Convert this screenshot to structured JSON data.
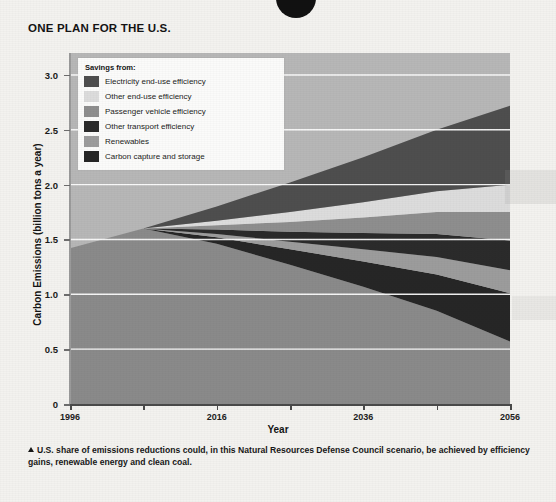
{
  "chart_title": "ONE PLAN FOR THE U.S.",
  "top_glyph": "circle-bullet",
  "legend": {
    "title": "Savings from:",
    "items": [
      {
        "label": "Electricity end-use efficiency",
        "color": "#4e4e4e"
      },
      {
        "label": "Other end-use efficiency",
        "color": "#dcdcdc"
      },
      {
        "label": "Passenger vehicle efficiency",
        "color": "#8e8e8e"
      },
      {
        "label": "Other transport efficiency",
        "color": "#2b2b2b"
      },
      {
        "label": "Renewables",
        "color": "#9c9c9c"
      },
      {
        "label": "Carbon capture and storage",
        "color": "#262626"
      }
    ]
  },
  "caption": "U.S. share of emissions reductions could, in this Natural Resources Defense Council scenario, be achieved by efficiency gains, renewable energy and clean coal.",
  "chart_data": {
    "type": "area",
    "title": "ONE PLAN FOR THE U.S.",
    "xlabel": "Year",
    "ylabel": "Carbon Emissions (billion tons a year)",
    "xlim": [
      1996,
      2056
    ],
    "ylim": [
      0,
      3.2
    ],
    "grid": true,
    "grid_color": "#ffffff",
    "legend_position": "top-left-inside",
    "xticks": [
      1996,
      2016,
      2036,
      2056
    ],
    "xticks_minor": [
      2006,
      2026,
      2046
    ],
    "yticks": [
      0,
      0.5,
      1.0,
      1.5,
      2.0,
      2.5,
      3.0
    ],
    "ytick_labels": [
      "0",
      "0.5",
      "1.0",
      "1.5",
      "2.0",
      "2.5",
      "3.0"
    ],
    "plot_background": "#b7b7b7",
    "x": [
      1996,
      2006,
      2016,
      2026,
      2036,
      2046,
      2056
    ],
    "series": [
      {
        "name": "Business-as-usual total (top of stack)",
        "role": "envelope",
        "values": [
          1.42,
          1.6,
          1.8,
          2.02,
          2.25,
          2.5,
          2.72
        ]
      },
      {
        "name": "Electricity end-use efficiency",
        "color": "#4e4e4e",
        "values": [
          0.0,
          0.0,
          0.13,
          0.27,
          0.41,
          0.56,
          0.72
        ]
      },
      {
        "name": "Other end-use efficiency",
        "color": "#dcdcdc",
        "values": [
          0.0,
          0.0,
          0.04,
          0.09,
          0.14,
          0.19,
          0.25
        ]
      },
      {
        "name": "Passenger vehicle efficiency",
        "color": "#8e8e8e",
        "values": [
          0.0,
          0.0,
          0.04,
          0.09,
          0.14,
          0.2,
          0.26
        ]
      },
      {
        "name": "Other transport efficiency",
        "color": "#2b2b2b",
        "values": [
          0.0,
          0.0,
          0.04,
          0.09,
          0.15,
          0.21,
          0.27
        ]
      },
      {
        "name": "Renewables",
        "color": "#9c9c9c",
        "values": [
          0.0,
          0.0,
          0.03,
          0.07,
          0.11,
          0.16,
          0.21
        ]
      },
      {
        "name": "Carbon capture and storage",
        "color": "#262626",
        "values": [
          0.0,
          0.0,
          0.06,
          0.14,
          0.23,
          0.33,
          0.44
        ]
      },
      {
        "name": "Remaining emissions",
        "color": "#8a8a8a",
        "values": [
          1.42,
          1.6,
          1.46,
          1.27,
          1.07,
          0.85,
          0.57
        ]
      }
    ]
  }
}
